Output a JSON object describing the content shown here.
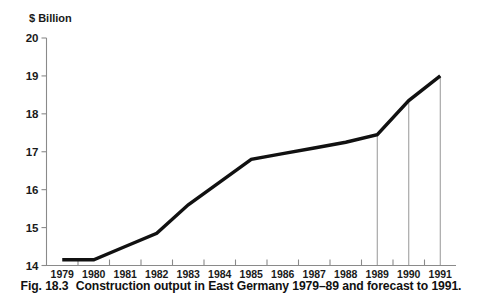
{
  "figure": {
    "caption_number": "Fig. 18.3",
    "caption_text": "Construction output in East Germany 1979–89 and forecast to 1991."
  },
  "chart_data": {
    "type": "line",
    "title": "",
    "subtitle": "",
    "ylabel": "$ Billion",
    "xlabel": "",
    "ylim": [
      14,
      20
    ],
    "yticks": [
      14,
      15,
      16,
      17,
      18,
      19,
      20
    ],
    "ytick_labels": [
      "14",
      "15",
      "16",
      "17",
      "18",
      "19",
      "20"
    ],
    "grid": false,
    "legend": null,
    "categories": [
      1979,
      1980,
      1981,
      1982,
      1983,
      1984,
      1985,
      1986,
      1987,
      1988,
      1989,
      1990,
      1991
    ],
    "xtick_labels": [
      "1979",
      "1980",
      "1981",
      "1982",
      "1983",
      "1984",
      "1985",
      "1986",
      "1987",
      "1988",
      "1989",
      "1990",
      "1991"
    ],
    "series": [
      {
        "name": "Construction output",
        "color": "#111111",
        "values": [
          14.15,
          14.15,
          14.5,
          14.85,
          15.6,
          16.2,
          16.8,
          16.95,
          17.1,
          17.25,
          17.45,
          18.35,
          19.0
        ]
      }
    ],
    "annotations": {
      "drop_lines_at": [
        1989,
        1990,
        1991
      ],
      "drop_line_color": "#8a8a8a",
      "forecast_from": 1989
    }
  }
}
